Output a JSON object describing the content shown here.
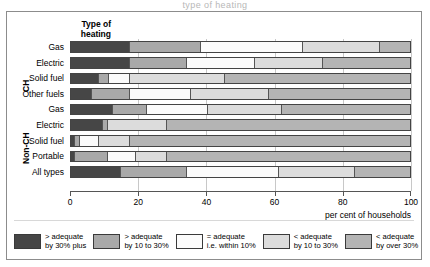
{
  "top_crop_text": "type of heating",
  "chart_data": {
    "type": "bar",
    "orientation": "horizontal",
    "stacked": true,
    "stack_total": 100,
    "title": "",
    "xlabel": "per cent  of households",
    "ylabel": "Type of heating",
    "xlim": [
      0,
      100
    ],
    "xticks": [
      0,
      20,
      40,
      60,
      80,
      100
    ],
    "grid": true,
    "legend_position": "bottom",
    "group_labels": [
      "CH",
      "Non-CH"
    ],
    "categories": [
      "Gas",
      "Electric",
      "Solid fuel",
      "Other fuels",
      "Gas",
      "Electric",
      "Solid fuel",
      "Portable",
      "All types"
    ],
    "row_groups": [
      "CH",
      "CH",
      "CH",
      "CH",
      "Non-CH",
      "Non-CH",
      "Non-CH",
      "Non-CH",
      ""
    ],
    "series": [
      {
        "name": "> adequate by 30% plus",
        "color": "#464646",
        "values": [
          17,
          17,
          8,
          6,
          12,
          9,
          1,
          1,
          14.5
        ]
      },
      {
        "name": "> adequate by 10 to 30%",
        "color": "#a9a9a9",
        "values": [
          21,
          17,
          3,
          11,
          10,
          1.5,
          1.5,
          9.5,
          19.5
        ]
      },
      {
        "name": "= adequate i.e. within 10%",
        "color": "#fbfbfb",
        "values": [
          30,
          20,
          6,
          18,
          18,
          0,
          5.5,
          8.5,
          27
        ]
      },
      {
        "name": "< adequate by 10 to 30%",
        "color": "#dcdcdc",
        "values": [
          23,
          20,
          28,
          23,
          22,
          17.5,
          9,
          9,
          22.5
        ]
      },
      {
        "name": "< adequate by over 30%",
        "color": "#b4b4b4",
        "values": [
          9,
          26,
          55,
          42,
          38,
          72,
          83,
          72,
          16.5
        ]
      }
    ]
  },
  "axis_title": {
    "line1": "Type of",
    "line2": "heating"
  },
  "legend": {
    "items": [
      {
        "color": "#464646",
        "line1": "> adequate",
        "line2": "by 30% plus"
      },
      {
        "color": "#a9a9a9",
        "line1": "> adequate",
        "line2": "by 10 to 30%"
      },
      {
        "color": "#fbfbfb",
        "line1": "= adequate",
        "line2": "i.e. within 10%"
      },
      {
        "color": "#dcdcdc",
        "line1": "< adequate",
        "line2": "by 10 to 30%"
      },
      {
        "color": "#b4b4b4",
        "line1": "< adequate",
        "line2": "by over 30%"
      }
    ]
  }
}
